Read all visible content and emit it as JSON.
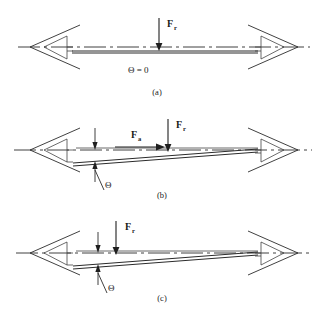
{
  "figure": {
    "background_color": "#ffffff",
    "line_color": "#2b2b2b",
    "width": 324,
    "height": 327
  },
  "panels": [
    {
      "id": "a",
      "label": "(a)",
      "label_x": 157,
      "label_y": 95,
      "axis_y": 47,
      "beam_left_y": 51,
      "beam_right_y": 51,
      "tilt_state": "level",
      "angle_text": "Θ = 0",
      "angle_text_x": 128,
      "angle_text_y": 73,
      "has_angle_indicator": false,
      "forces": [
        {
          "name": "F_r",
          "symbol": "F",
          "subscript": "r",
          "direction": "down",
          "label_x": 167,
          "label_y": 27,
          "arrow_x": 159,
          "arrow_y_start": 18,
          "arrow_y_end": 49
        }
      ]
    },
    {
      "id": "b",
      "label": "(b)",
      "label_x": 162,
      "label_y": 198,
      "axis_y": 150,
      "beam_left_y": 160,
      "beam_right_y": 150,
      "tilt_state": "tilted",
      "angle_text": "Θ",
      "angle_text_x": 105,
      "angle_text_y": 188,
      "has_angle_indicator": true,
      "forces": [
        {
          "name": "F_a",
          "symbol": "F",
          "subscript": "a",
          "direction": "right",
          "label_x": 131,
          "label_y": 138,
          "arrow_x_start": 115,
          "arrow_x_end": 162,
          "arrow_y": 147
        },
        {
          "name": "F_r",
          "symbol": "F",
          "subscript": "r",
          "direction": "down",
          "label_x": 176,
          "label_y": 128,
          "arrow_x": 168,
          "arrow_y_start": 119,
          "arrow_y_end": 150
        }
      ]
    },
    {
      "id": "c",
      "label": "(c)",
      "label_x": 162,
      "label_y": 301,
      "axis_y": 253,
      "beam_left_y": 263,
      "beam_right_y": 253,
      "tilt_state": "tilted",
      "angle_text": "Θ",
      "angle_text_x": 108,
      "angle_text_y": 291,
      "has_angle_indicator": true,
      "forces": [
        {
          "name": "F_r",
          "symbol": "F",
          "subscript": "r",
          "direction": "down",
          "label_x": 125,
          "label_y": 230,
          "arrow_x": 116,
          "arrow_y_start": 221,
          "arrow_y_end": 253
        }
      ]
    }
  ],
  "symbols": {
    "theta": "Θ",
    "force_radial": "F",
    "force_radial_sub": "r",
    "force_axial": "F",
    "force_axial_sub": "a",
    "theta_zero": "Θ = 0"
  }
}
